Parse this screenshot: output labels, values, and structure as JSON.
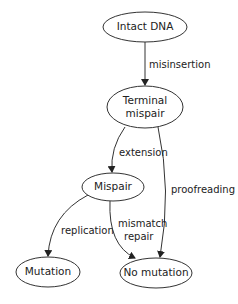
{
  "diagram": {
    "type": "state-transition",
    "nodes": [
      {
        "id": "intact",
        "label": "Intact DNA"
      },
      {
        "id": "terminal",
        "label_line1": "Terminal",
        "label_line2": "mispair"
      },
      {
        "id": "mispair",
        "label": "Mispair"
      },
      {
        "id": "mutation",
        "label": "Mutation"
      },
      {
        "id": "nomutation",
        "label": "No mutation"
      }
    ],
    "edges": [
      {
        "from": "intact",
        "to": "terminal",
        "label": "misinsertion"
      },
      {
        "from": "terminal",
        "to": "mispair",
        "label": "extension"
      },
      {
        "from": "terminal",
        "to": "nomutation",
        "label": "proofreading"
      },
      {
        "from": "mispair",
        "to": "mutation",
        "label": "replication"
      },
      {
        "from": "mispair",
        "to": "nomutation",
        "label_line1": "mismatch",
        "label_line2": "repair"
      }
    ]
  }
}
